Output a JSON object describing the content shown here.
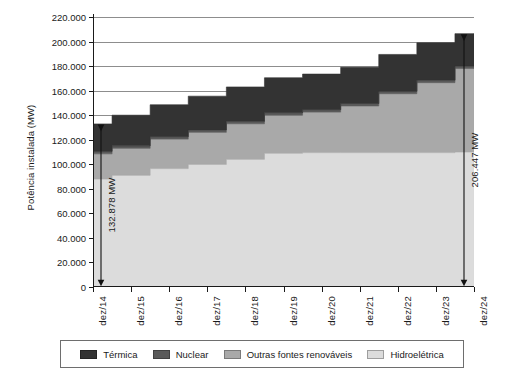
{
  "chart_data": {
    "type": "area",
    "title": "",
    "xlabel": "",
    "ylabel": "Potência instalada (MW)",
    "ylim": [
      0,
      220000
    ],
    "ytick_step": 20000,
    "grid": true,
    "stacked": true,
    "step": true,
    "legend_position": "bottom",
    "categories": [
      "dez/14",
      "dez/15",
      "dez/16",
      "dez/17",
      "dez/18",
      "dez/19",
      "dez/20",
      "dez/21",
      "dez/22",
      "dez/23",
      "dez/24"
    ],
    "ytick_labels": [
      "0",
      "20.000",
      "40.000",
      "60.000",
      "80.000",
      "100.000",
      "120.000",
      "140.000",
      "160.000",
      "180.000",
      "200.000",
      "220.000"
    ],
    "ytick_values": [
      0,
      20000,
      40000,
      60000,
      80000,
      100000,
      120000,
      140000,
      160000,
      180000,
      200000,
      220000
    ],
    "series": [
      {
        "name": "Hidroelétrica",
        "color": "#dcdcdc",
        "values": [
          88000,
          91000,
          96500,
          100000,
          104000,
          109000,
          109500,
          109500,
          109500,
          109500,
          110000
        ]
      },
      {
        "name": "Outras fontes renováveis",
        "color": "#a9a9a9",
        "values": [
          20500,
          22000,
          24000,
          26000,
          29000,
          31000,
          33000,
          38000,
          48000,
          57000,
          68000
        ]
      },
      {
        "name": "Nuclear",
        "color": "#5a5a5a",
        "values": [
          2000,
          2000,
          2000,
          2000,
          2000,
          2000,
          2000,
          2000,
          2000,
          2000,
          2000
        ]
      },
      {
        "name": "Térmica",
        "color": "#333333",
        "values": [
          22378,
          25000,
          26000,
          27500,
          28000,
          28500,
          29000,
          29500,
          30000,
          30500,
          26447
        ]
      }
    ],
    "totals": [
      132878,
      140000,
      148500,
      155500,
      163000,
      170500,
      173500,
      179000,
      189500,
      199000,
      206447
    ],
    "annotations": [
      {
        "text": "132.878 MW",
        "at_category": "dez/14",
        "value": 132878,
        "type": "double-arrow"
      },
      {
        "text": "206.447 MW",
        "at_category": "dez/24",
        "value": 206447,
        "type": "double-arrow"
      }
    ]
  },
  "legend": {
    "items": [
      {
        "label": "Térmica",
        "color": "#333333"
      },
      {
        "label": "Nuclear",
        "color": "#5a5a5a"
      },
      {
        "label": "Outras fontes renováveis",
        "color": "#a9a9a9"
      },
      {
        "label": "Hidroelétrica",
        "color": "#dcdcdc"
      }
    ]
  }
}
